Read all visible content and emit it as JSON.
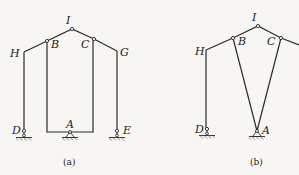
{
  "figure_a": {
    "caption": "(a)",
    "labels": {
      "H": "H",
      "B": "B",
      "I": "I",
      "C": "C",
      "G": "G",
      "D": "D",
      "A": "A",
      "E": "E"
    }
  },
  "figure_b": {
    "caption": "(b)",
    "labels": {
      "H": "H",
      "B": "B",
      "I": "I",
      "C": "C",
      "D": "D",
      "A": "A"
    }
  },
  "colors": {
    "line": "#2a2a2a",
    "background": "#f7f6f2"
  }
}
